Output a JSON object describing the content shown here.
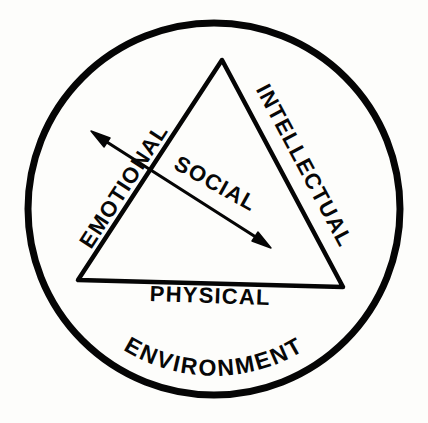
{
  "diagram": {
    "background_color": "#fdfdfb",
    "ink_color": "#050505",
    "outer_ring": {
      "name": "environment-ring",
      "label": "ENVIRONMENT",
      "shape": "circle",
      "center_x": 214,
      "center_y": 209,
      "radius": 186,
      "stroke_width": 7
    },
    "triangle": {
      "name": "dimensions-triangle",
      "shape": "triangle",
      "stroke_width": 4.5,
      "vertices": [
        {
          "name": "apex",
          "x": 222,
          "y": 60
        },
        {
          "name": "bottom-left",
          "x": 78,
          "y": 280
        },
        {
          "name": "bottom-right",
          "x": 343,
          "y": 287
        }
      ]
    },
    "sides": [
      {
        "name": "left-side",
        "label": "EMOTIONAL",
        "rotation_deg": -57,
        "font_size": 22
      },
      {
        "name": "right-side",
        "label": "INTELLECTUAL",
        "rotation_deg": 62,
        "font_size": 22
      },
      {
        "name": "bottom-side",
        "label": "PHYSICAL",
        "rotation_deg": 2,
        "font_size": 22
      }
    ],
    "arrow": {
      "name": "social-axis-arrow",
      "label": "SOCIAL",
      "label_rotation_deg": 29,
      "label_font_size": 22,
      "double_headed": true,
      "start_x": 93,
      "start_y": 133,
      "end_x": 268,
      "end_y": 245,
      "stroke_width": 3.2,
      "head_length": 15,
      "head_width": 9
    },
    "labels": {
      "environment": "ENVIRONMENT",
      "emotional": "EMOTIONAL",
      "intellectual": "INTELLECTUAL",
      "physical": "PHYSICAL",
      "social": "SOCIAL"
    }
  }
}
